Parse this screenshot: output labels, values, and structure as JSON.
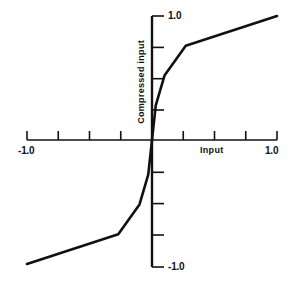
{
  "chart_data": {
    "type": "line",
    "title": "",
    "subtitle": "",
    "xlabel": "Input",
    "ylabel": "Compressed input",
    "xlim": [
      -1.0,
      1.0
    ],
    "ylim": [
      -1.0,
      1.0
    ],
    "grid": false,
    "legend": null,
    "x_tick_values": [
      -1.0,
      -0.75,
      -0.5,
      -0.25,
      0.0,
      0.25,
      0.5,
      0.75,
      1.0
    ],
    "x_tick_labels": [
      "-1.0",
      "",
      "",
      "",
      "",
      "",
      "",
      "",
      "1.0"
    ],
    "y_tick_values": [
      -1.0,
      -0.75,
      -0.5,
      -0.25,
      0.0,
      0.25,
      0.5,
      0.75,
      1.0
    ],
    "y_tick_labels": [
      "-1.0",
      "",
      "",
      "",
      "",
      "",
      "",
      "",
      "1.0"
    ],
    "annotations": [],
    "series": [
      {
        "name": "Compression characteristic",
        "x": [
          -1.0,
          -0.27,
          -0.1,
          -0.03,
          0.0,
          0.03,
          0.1,
          0.27,
          1.0
        ],
        "y": [
          -1.0,
          -0.76,
          -0.52,
          -0.28,
          0.0,
          0.28,
          0.52,
          0.76,
          1.0
        ]
      }
    ]
  },
  "axes": {
    "x_min_label": "-1.0",
    "x_max_label": "1.0",
    "y_max_label": "1.0",
    "y_min_label": "-1.0",
    "x_title": "Input",
    "y_title": "Compressed input"
  },
  "colors": {
    "curve": "#111111",
    "axis": "#111111",
    "background": "#ffffff"
  }
}
